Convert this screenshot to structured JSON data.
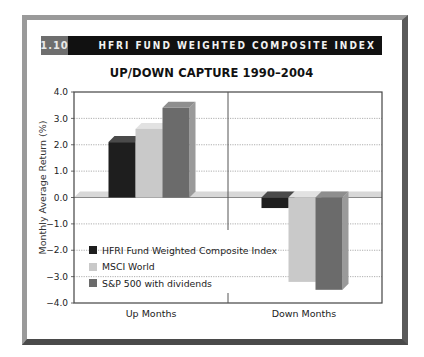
{
  "header": {
    "figure_number": "1.10",
    "title": "HFRI FUND WEIGHTED COMPOSITE INDEX"
  },
  "chart_data": {
    "type": "bar",
    "title": "UP/DOWN CAPTURE 1990–2004",
    "xlabel": "",
    "ylabel": "Monthly Average Return (%)",
    "categories": [
      "Up Months",
      "Down Months"
    ],
    "series": [
      {
        "name": "HFRI Fund Weighted Composite Index",
        "color": "#1e1e1e",
        "values": [
          2.1,
          -0.4
        ]
      },
      {
        "name": "MSCI World",
        "color": "#c9c9c9",
        "values": [
          2.6,
          -3.2
        ]
      },
      {
        "name": "S&P 500 with dividends",
        "color": "#6b6b6b",
        "values": [
          3.4,
          -3.5
        ]
      }
    ],
    "ylim": [
      -4.0,
      4.0
    ],
    "yticks": [
      "4.0",
      "3.0",
      "2.0",
      "1.0",
      "0.0",
      "-1.0",
      "-2.0",
      "-3.0",
      "-4.0"
    ],
    "grid": true,
    "legend_position": "lower left inside plot",
    "style": "3D bars"
  }
}
